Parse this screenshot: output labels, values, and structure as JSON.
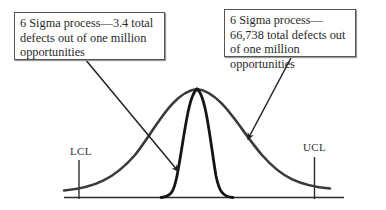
{
  "diagram": {
    "callouts": {
      "left": {
        "text": "6 Sigma process—3.4 total defects out of one million opportunities",
        "points_to": "narrow distribution"
      },
      "right": {
        "text": "6 Sigma process—66,738 total defects out of one million opportunities",
        "points_to": "wide distribution"
      }
    },
    "limits": {
      "lower": "LCL",
      "upper": "UCL"
    },
    "curves": [
      {
        "name": "wide-distribution",
        "description": "broad bell curve extending beyond control limits"
      },
      {
        "name": "narrow-distribution",
        "description": "tall narrow bell curve well within control limits"
      }
    ],
    "colors": {
      "line": "#2b2b2b",
      "wide_curve": "#3a3a3a",
      "narrow_curve": "#151515",
      "box_border": "#555555"
    }
  }
}
